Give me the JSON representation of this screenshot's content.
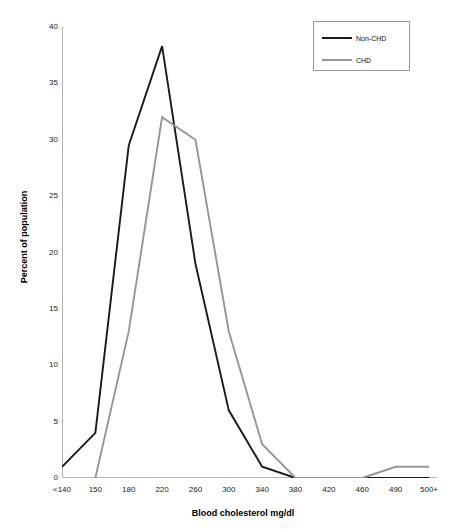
{
  "chart_data": {
    "type": "line",
    "title": "Blood cholesterol distribution in those with CHD versus those free of CHD",
    "xlabel": "Blood cholesterol mg/dl",
    "ylabel": "Percent of population",
    "categories": [
      "<140",
      "150",
      "180",
      "220",
      "260",
      "300",
      "340",
      "380",
      "420",
      "460",
      "490",
      "500+"
    ],
    "series": [
      {
        "name": "Non-CHD",
        "color": "#1a1a1a",
        "values": [
          1,
          4,
          29.5,
          38.3,
          19,
          6,
          1,
          0,
          0,
          0,
          0,
          0
        ]
      },
      {
        "name": "CHD",
        "color": "#969696",
        "values": [
          null,
          0,
          13,
          32,
          30,
          13,
          3,
          0,
          0,
          0,
          1,
          1
        ]
      }
    ],
    "ylim": [
      0,
      40
    ],
    "yticks": [
      0,
      5,
      10,
      15,
      20,
      25,
      30,
      35,
      40
    ],
    "grid": false,
    "legend_position": "top-right"
  },
  "axes": {
    "y_tick_labels": [
      "40",
      "35",
      "30",
      "25",
      "20",
      "15",
      "10",
      "5",
      "0"
    ],
    "x_tick_labels": [
      "<140",
      "150",
      "180",
      "220",
      "260",
      "300",
      "340",
      "380",
      "420",
      "460",
      "490",
      "500+"
    ],
    "y_title": "Percent of population",
    "x_title": "Blood cholesterol mg/dl"
  },
  "legend": {
    "entries": [
      {
        "label": "Non-CHD",
        "color": "#1a1a1a"
      },
      {
        "label": "CHD",
        "color": "#969696"
      }
    ]
  }
}
